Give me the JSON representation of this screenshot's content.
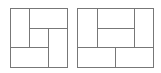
{
  "diagram": {
    "stroke_color": "#777777",
    "background": "#ffffff",
    "figures": [
      {
        "name": "left-square-tiling",
        "outer": {
          "x": 10,
          "y": 8,
          "w": 57,
          "h": 59
        },
        "lines": [
          [
            29,
            8,
            29,
            47
          ],
          [
            29,
            28,
            67,
            28
          ],
          [
            48,
            28,
            48,
            67
          ],
          [
            10,
            47,
            48,
            47
          ]
        ]
      },
      {
        "name": "right-rectangle-tiling",
        "outer": {
          "x": 77,
          "y": 8,
          "w": 76,
          "h": 59
        },
        "lines": [
          [
            97,
            8,
            97,
            47
          ],
          [
            134,
            8,
            134,
            47
          ],
          [
            97,
            28,
            134,
            28
          ],
          [
            77,
            47,
            153,
            47
          ],
          [
            115,
            47,
            115,
            67
          ]
        ]
      }
    ]
  }
}
